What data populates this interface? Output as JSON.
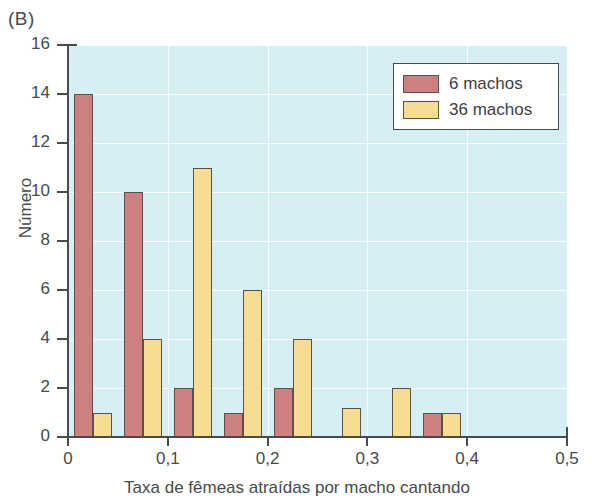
{
  "panel": {
    "label": "(B)"
  },
  "chart_data": {
    "type": "bar",
    "title": "",
    "panel_label": "(B)",
    "xlabel": "Taxa de fêmeas atraídas por macho cantando",
    "ylabel": "Número",
    "xlim": [
      0,
      0.5
    ],
    "ylim": [
      0,
      16
    ],
    "ytick_labels": [
      "0",
      "2",
      "4",
      "6",
      "8",
      "10",
      "12",
      "14",
      "16"
    ],
    "ytick_values": [
      0,
      2,
      4,
      6,
      8,
      10,
      12,
      14,
      16
    ],
    "xtick_labels": [
      "0",
      "0,1",
      "0,2",
      "0,3",
      "0,4",
      "0,5"
    ],
    "xtick_values": [
      0,
      0.1,
      0.2,
      0.3,
      0.4,
      0.5
    ],
    "grid": true,
    "grid_color": "#ffffff",
    "plot_background": "#d6eff5",
    "legend_position": "top-right",
    "bin_width": 0.05,
    "bin_centers": [
      0.025,
      0.075,
      0.125,
      0.175,
      0.225,
      0.275,
      0.325,
      0.375
    ],
    "series": [
      {
        "name": "6 machos",
        "color": "#cc8080",
        "values": [
          14,
          10,
          2,
          1,
          2,
          0,
          0,
          1
        ]
      },
      {
        "name": "36 machos",
        "color": "#f7dd92",
        "values": [
          1,
          4,
          11,
          6,
          4,
          1.2,
          2,
          1
        ]
      }
    ]
  },
  "legend": {
    "entries": [
      {
        "label": "6 machos",
        "color": "#cc8080"
      },
      {
        "label": "36 machos",
        "color": "#f7dd92"
      }
    ]
  }
}
